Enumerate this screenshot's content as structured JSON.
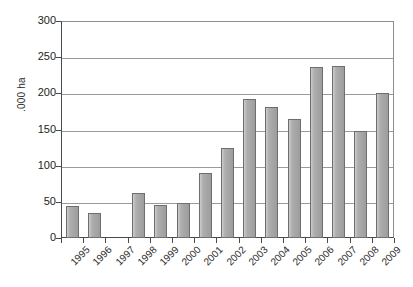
{
  "chart_data": {
    "type": "bar",
    "title": "",
    "subtitle": "",
    "xlabel": "",
    "ylabel": ".000 ha",
    "ylim": [
      0,
      300
    ],
    "ytick_step": 50,
    "yticks": [
      0,
      50,
      100,
      150,
      200,
      250,
      300
    ],
    "grid": true,
    "legend": false,
    "legend_position": "none",
    "bar_color": "#a3a3a3",
    "bar_border_color": "#6e6e6e",
    "axis_color": "#4a4a4a",
    "gridline_color": "#9a9a9a",
    "categories": [
      "1995",
      "1996",
      "1997",
      "1998",
      "1999",
      "2000",
      "2001",
      "2002",
      "2003",
      "2004",
      "2005",
      "2006",
      "2007",
      "2008",
      "2009"
    ],
    "values": [
      44,
      35,
      0,
      62,
      45,
      48,
      90,
      124,
      192,
      181,
      164,
      236,
      238,
      148,
      200
    ],
    "series": [
      {
        "name": "Area",
        "values": [
          44,
          35,
          0,
          62,
          45,
          48,
          90,
          124,
          192,
          181,
          164,
          236,
          238,
          148,
          200
        ]
      }
    ],
    "annotations": []
  },
  "axes": {
    "y_tick_labels": [
      "300",
      "250",
      "200",
      "150",
      "100",
      "50",
      "0"
    ],
    "y_axis_title": ".000 ha",
    "x_tick_labels": [
      "1995",
      "1996",
      "1997",
      "1998",
      "1999",
      "2000",
      "2001",
      "2002",
      "2003",
      "2004",
      "2005",
      "2006",
      "2007",
      "2008",
      "2009"
    ]
  }
}
